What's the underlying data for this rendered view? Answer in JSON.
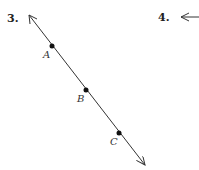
{
  "problems": [
    {
      "number": "3.",
      "figure": "line",
      "points": [
        {
          "label": "A",
          "x": 52,
          "y": 46
        },
        {
          "label": "B",
          "x": 86,
          "y": 90
        },
        {
          "label": "C",
          "x": 119,
          "y": 133
        }
      ],
      "line_start": {
        "x": 29,
        "y": 15
      },
      "line_end": {
        "x": 145,
        "y": 165
      }
    },
    {
      "number": "4.",
      "figure": "ray-arrow-left"
    }
  ],
  "colors": {
    "line": "#333333",
    "point": "#111111"
  }
}
